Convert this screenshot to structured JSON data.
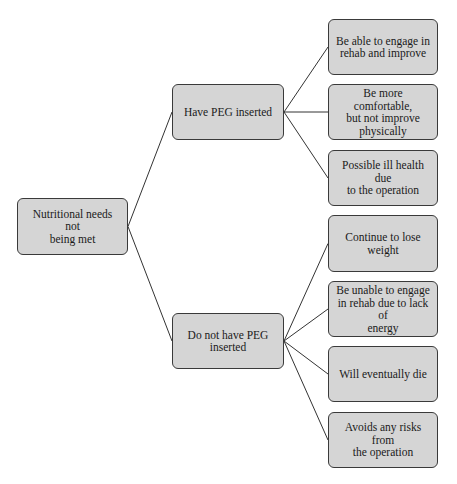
{
  "diagram": {
    "root": {
      "id": "root",
      "label": "Nutritional needs not\nbeing met",
      "box": {
        "x": 17,
        "y": 198,
        "w": 111,
        "h": 57
      }
    },
    "branches": [
      {
        "id": "have-peg",
        "label": "Have PEG inserted",
        "box": {
          "x": 172,
          "y": 84,
          "w": 112,
          "h": 56
        },
        "outcomes": [
          {
            "id": "outcome-1",
            "label": "Be able to  engage in\nrehab and improve",
            "box": {
              "x": 328,
              "y": 19,
              "w": 110,
              "h": 56
            }
          },
          {
            "id": "outcome-2",
            "label": "Be more comfortable,\nbut  not improve\nphysically",
            "box": {
              "x": 328,
              "y": 84,
              "w": 110,
              "h": 56
            }
          },
          {
            "id": "outcome-3",
            "label": "Possible ill health due\nto the operation",
            "box": {
              "x": 328,
              "y": 150,
              "w": 110,
              "h": 56
            }
          }
        ]
      },
      {
        "id": "no-peg",
        "label": "Do not have PEG\ninserted",
        "box": {
          "x": 172,
          "y": 313,
          "w": 112,
          "h": 56
        },
        "outcomes": [
          {
            "id": "outcome-4",
            "label": "Continue to lose\nweight",
            "box": {
              "x": 328,
              "y": 215,
              "w": 110,
              "h": 57
            }
          },
          {
            "id": "outcome-5",
            "label": "Be unable to engage\nin rehab due to lack of\nenergy",
            "box": {
              "x": 328,
              "y": 281,
              "w": 110,
              "h": 56
            }
          },
          {
            "id": "outcome-6",
            "label": "Will eventually die",
            "box": {
              "x": 328,
              "y": 346,
              "w": 110,
              "h": 56
            }
          },
          {
            "id": "outcome-7",
            "label": "Avoids any risks from\nthe operation",
            "box": {
              "x": 328,
              "y": 412,
              "w": 110,
              "h": 56
            }
          }
        ]
      }
    ],
    "colors": {
      "node_fill": "#d5d5d5",
      "node_border": "#3a3a3a",
      "line": "#333333",
      "text": "#1a1a1a",
      "background": "#ffffff"
    }
  }
}
